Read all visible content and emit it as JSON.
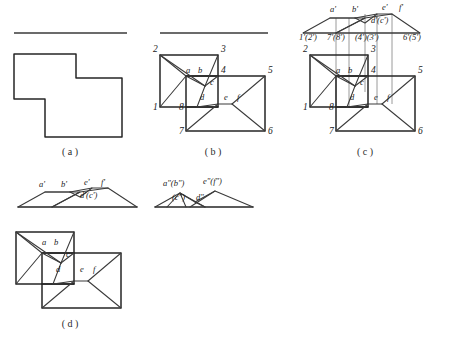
{
  "figure": {
    "stroke_color": "#262626",
    "thin_color": "#3a3a3a",
    "projection_line_color": "#9a9a9a",
    "background": "#ffffff"
  },
  "panels": [
    {
      "id": "a",
      "caption": "( a )",
      "description": "L-shaped outline with reference rule above"
    },
    {
      "id": "b",
      "caption": "( b )",
      "description": "Two overlapping rectangles with diagonals, numbered and lettered vertices"
    },
    {
      "id": "c",
      "caption": "( c )",
      "description": "Front view above top view joined by vertical projection lines"
    },
    {
      "id": "d",
      "caption": "( d )",
      "description": "Front view, side view and top view of the completed solid"
    }
  ],
  "panel_b": {
    "numbers": [
      {
        "text": "1",
        "x": 153,
        "y": 110
      },
      {
        "text": "2",
        "x": 153,
        "y": 52
      },
      {
        "text": "3",
        "x": 221,
        "y": 52
      },
      {
        "text": "4",
        "x": 221,
        "y": 73
      },
      {
        "text": "5",
        "x": 268,
        "y": 73
      },
      {
        "text": "6",
        "x": 268,
        "y": 134
      },
      {
        "text": "7",
        "x": 179,
        "y": 134
      },
      {
        "text": "8",
        "x": 179,
        "y": 110
      }
    ],
    "letters": [
      {
        "text": "a",
        "x": 186,
        "y": 73
      },
      {
        "text": "b",
        "x": 198,
        "y": 73
      },
      {
        "text": "c",
        "x": 210,
        "y": 85
      },
      {
        "text": "d",
        "x": 200,
        "y": 100
      },
      {
        "text": "e",
        "x": 224,
        "y": 100
      },
      {
        "text": "f",
        "x": 237,
        "y": 100
      }
    ]
  },
  "panel_c": {
    "top_labels": [
      {
        "text": "a'",
        "x": 330,
        "y": 12
      },
      {
        "text": "b'",
        "x": 352,
        "y": 12
      },
      {
        "text": "e'",
        "x": 382,
        "y": 10
      },
      {
        "text": "f'",
        "x": 399,
        "y": 10
      },
      {
        "text": "d'(c')",
        "x": 371,
        "y": 23
      }
    ],
    "axis_labels": [
      {
        "text": "1'(2')",
        "x": 299,
        "y": 40
      },
      {
        "text": "7'(8')",
        "x": 327,
        "y": 40
      },
      {
        "text": "(4')(3')",
        "x": 355,
        "y": 40
      },
      {
        "text": "6'(5')",
        "x": 403,
        "y": 40
      }
    ],
    "numbers": [
      {
        "text": "1",
        "x": 303,
        "y": 110
      },
      {
        "text": "2",
        "x": 303,
        "y": 52
      },
      {
        "text": "3",
        "x": 371,
        "y": 52
      },
      {
        "text": "4",
        "x": 371,
        "y": 73
      },
      {
        "text": "5",
        "x": 418,
        "y": 73
      },
      {
        "text": "6",
        "x": 418,
        "y": 134
      },
      {
        "text": "7",
        "x": 329,
        "y": 134
      },
      {
        "text": "8",
        "x": 329,
        "y": 110
      }
    ],
    "letters": [
      {
        "text": "a",
        "x": 336,
        "y": 73
      },
      {
        "text": "b",
        "x": 348,
        "y": 73
      },
      {
        "text": "c",
        "x": 360,
        "y": 85
      },
      {
        "text": "d",
        "x": 350,
        "y": 100
      },
      {
        "text": "e",
        "x": 374,
        "y": 100
      },
      {
        "text": "f",
        "x": 387,
        "y": 100
      }
    ]
  },
  "panel_d": {
    "front_labels": [
      {
        "text": "a'",
        "x": 39,
        "y": 187
      },
      {
        "text": "b'",
        "x": 61,
        "y": 187
      },
      {
        "text": "e'",
        "x": 84,
        "y": 185
      },
      {
        "text": "f'",
        "x": 101,
        "y": 185
      },
      {
        "text": "d'(c')",
        "x": 80,
        "y": 198
      }
    ],
    "side_labels": [
      {
        "text": "a\"(b\")",
        "x": 163,
        "y": 186
      },
      {
        "text": "e\"(f\")",
        "x": 203,
        "y": 184
      },
      {
        "text": "(c\")",
        "x": 172,
        "y": 200
      },
      {
        "text": "d\"",
        "x": 196,
        "y": 200
      }
    ],
    "top_letters": [
      {
        "text": "a",
        "x": 42,
        "y": 245
      },
      {
        "text": "b",
        "x": 54,
        "y": 245
      },
      {
        "text": "c",
        "x": 66,
        "y": 257
      },
      {
        "text": "d",
        "x": 56,
        "y": 272
      },
      {
        "text": "e",
        "x": 80,
        "y": 272
      },
      {
        "text": "f",
        "x": 93,
        "y": 272
      }
    ]
  }
}
